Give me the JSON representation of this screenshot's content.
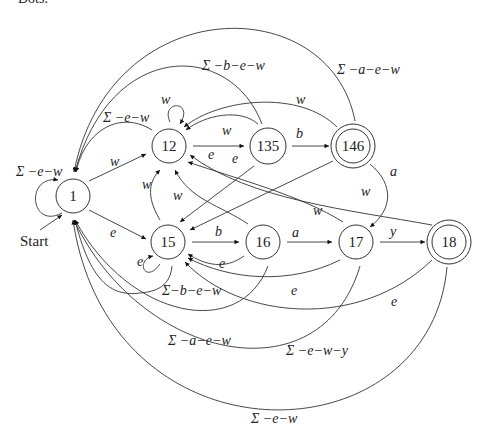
{
  "header": {
    "cut_text": "Dots."
  },
  "diagram": {
    "type": "finite-automaton",
    "start_label": "Start",
    "states": [
      {
        "id": "1",
        "label": "1",
        "accepting": false
      },
      {
        "id": "12",
        "label": "12",
        "accepting": false
      },
      {
        "id": "135",
        "label": "135",
        "accepting": false
      },
      {
        "id": "146",
        "label": "146",
        "accepting": true
      },
      {
        "id": "15",
        "label": "15",
        "accepting": false
      },
      {
        "id": "16",
        "label": "16",
        "accepting": false
      },
      {
        "id": "17",
        "label": "17",
        "accepting": false
      },
      {
        "id": "18",
        "label": "18",
        "accepting": true
      }
    ],
    "edge_labels": {
      "loop_1": "Σ −e−w",
      "e_1_12": "w",
      "e_1_15": "e",
      "loop_12": "w",
      "e_12_1": "Σ −e−w",
      "e_12_135": "e",
      "e_135_12": "w",
      "e_135_1": "Σ −b−e−w",
      "e_135_146": "b",
      "e_135_15": "e",
      "e_146_12": "w",
      "e_146_1": "Σ −a−e−w",
      "e_146_17": "a",
      "e_146_15": "e",
      "e_15_12": "w",
      "loop_15": "e",
      "e_15_16": "b",
      "e_15_1": "Σ−b−e−w",
      "e_16_12": "w",
      "e_16_17": "a",
      "e_16_15": "e",
      "e_16_1": "Σ −a−e−w",
      "e_17_12": "w",
      "e_17_18": "y",
      "e_17_15": "e",
      "e_17_1": "Σ −e−w−y",
      "e_18_12": "w",
      "e_18_15": "e",
      "e_18_1": "Σ −e−w"
    }
  }
}
